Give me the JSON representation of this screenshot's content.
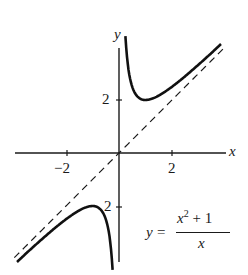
{
  "chart_data": {
    "type": "line",
    "title": "",
    "xlabel": "x",
    "ylabel": "y",
    "x_ticks": [
      -2,
      2
    ],
    "y_ticks": [
      2,
      -2
    ],
    "x_tick_labels": [
      "−2",
      "2"
    ],
    "y_tick_labels": [
      "2"
    ],
    "xlim": [
      -4.0,
      4.0
    ],
    "ylim": [
      -4.2,
      4.7
    ],
    "grid": false,
    "legend": null,
    "equation_label": {
      "lhs": "y",
      "eq": "=",
      "numerator_base": "x",
      "numerator_exp": "2",
      "numerator_rest": " + 1",
      "denominator": "x"
    },
    "series": [
      {
        "name": "y = (x^2+1)/x",
        "style": "solid",
        "function": "(x^2+1)/x",
        "branches": [
          {
            "x_range": [
              0.22,
              3.9
            ]
          },
          {
            "x_range": [
              -3.9,
              -0.22
            ]
          }
        ],
        "key_points": [
          {
            "x": 1,
            "y": 2
          },
          {
            "x": -1,
            "y": -2
          }
        ]
      },
      {
        "name": "asymptote y = x",
        "style": "dashed",
        "function": "x",
        "x_range": [
          -3.9,
          3.9
        ]
      }
    ]
  },
  "labels": {
    "x_axis": "x",
    "y_axis": "y",
    "tick_neg2": "−2",
    "tick_pos2": "2",
    "ytick_2": "2",
    "ytick_neg2": "2"
  }
}
